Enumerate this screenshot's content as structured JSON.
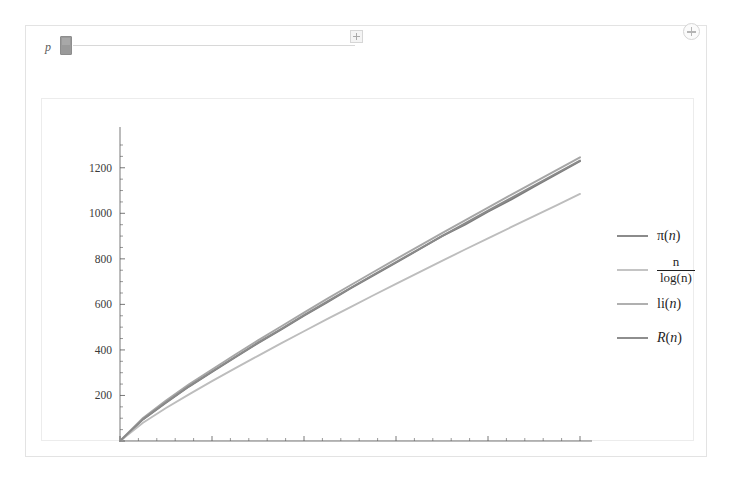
{
  "control": {
    "label": "p",
    "slider_name": "parameter-slider",
    "thumb_position": "min",
    "expand_icon": "plus-box-icon"
  },
  "corner": {
    "icon": "circle-plus-icon"
  },
  "chart_data": {
    "type": "line",
    "title": "",
    "xlabel": "",
    "ylabel": "",
    "xlim": [
      0,
      10000
    ],
    "ylim": [
      0,
      1300
    ],
    "grid": false,
    "legend_position": "right",
    "xticks": [
      0,
      2000,
      4000,
      6000,
      8000,
      10000
    ],
    "xtick_labels": [
      "",
      "2000",
      "4000",
      "6000",
      "8000",
      "10 000"
    ],
    "yticks": [
      0,
      200,
      400,
      600,
      800,
      1000,
      1200
    ],
    "ytick_labels": [
      "",
      "200",
      "400",
      "600",
      "800",
      "1000",
      "1200"
    ],
    "x": [
      0,
      500,
      1000,
      1500,
      2000,
      2500,
      3000,
      3500,
      4000,
      4500,
      5000,
      5500,
      6000,
      6500,
      7000,
      7500,
      8000,
      8500,
      9000,
      9500,
      10000
    ],
    "series": [
      {
        "name": "pi(n)",
        "label_html": "π(<i>n</i>)",
        "color": "#7d7d7d",
        "values": [
          0,
          95,
          168,
          239,
          303,
          367,
          430,
          489,
          550,
          609,
          669,
          726,
          783,
          841,
          900,
          950,
          1007,
          1060,
          1117,
          1173,
          1229
        ]
      },
      {
        "name": "n/log(n)",
        "label_html": "n/log(n)",
        "color": "#bdbdbd",
        "values": [
          0,
          80,
          145,
          205,
          263,
          319,
          374,
          429,
          482,
          535,
          587,
          639,
          690,
          741,
          791,
          841,
          890,
          939,
          988,
          1036,
          1085
        ]
      },
      {
        "name": "li(n)",
        "label_html": "li(<i>n</i>)",
        "color": "#a6a6a6",
        "values": [
          0,
          101,
          178,
          249,
          314,
          379,
          442,
          503,
          564,
          624,
          683,
          741,
          799,
          856,
          913,
          969,
          1025,
          1081,
          1136,
          1191,
          1246
        ]
      },
      {
        "name": "R(n)",
        "label_html": "R(<i>n</i>)",
        "color": "#8a8a8a",
        "values": [
          0,
          96,
          170,
          241,
          305,
          369,
          432,
          492,
          553,
          612,
          671,
          729,
          786,
          843,
          900,
          956,
          1012,
          1067,
          1122,
          1177,
          1232
        ]
      }
    ],
    "legend": [
      {
        "swatch_color": "#8b8b8b",
        "kind": "simple",
        "text": "π(n)"
      },
      {
        "swatch_color": "#c4c4c4",
        "kind": "fraction",
        "numerator": "n",
        "denominator": "log(n)"
      },
      {
        "swatch_color": "#b0b0b0",
        "kind": "simple",
        "text": "li(n)"
      },
      {
        "swatch_color": "#8e8e8e",
        "kind": "simple",
        "text": "R(n)"
      }
    ]
  }
}
